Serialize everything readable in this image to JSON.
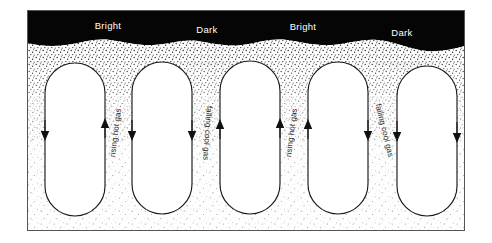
{
  "figure": {
    "frame": {
      "x": 27,
      "y": 10,
      "width": 438,
      "height": 221,
      "border_color": "#4a4a4a"
    },
    "colors": {
      "photosphere_dark": "#050505",
      "stipple": "#2b2b2b",
      "cell_fill": "#ffffff",
      "cell_outline": "#1a1a1a",
      "frame": "#555555",
      "surface_text": "#ffffff",
      "flow_text": "#2a2a2a"
    },
    "surface_labels": [
      {
        "text": "Bright",
        "x": 108,
        "y": 29,
        "region": "rising-column-1"
      },
      {
        "text": "Dark",
        "x": 207,
        "y": 33,
        "region": "falling-column-1"
      },
      {
        "text": "Bright",
        "x": 303,
        "y": 30,
        "region": "rising-column-2"
      },
      {
        "text": "Dark",
        "x": 402,
        "y": 36,
        "region": "falling-column-2"
      }
    ],
    "flow_labels": [
      {
        "text": "rising hot gas",
        "x": 118,
        "y": 133,
        "rotate": -83,
        "kind": "rising"
      },
      {
        "text": "falling cool gas",
        "x": 205,
        "y": 133,
        "rotate": 94,
        "kind": "falling"
      },
      {
        "text": "rising hot gas",
        "x": 294,
        "y": 133,
        "rotate": -83,
        "kind": "rising"
      },
      {
        "text": "falling cool gas",
        "x": 382,
        "y": 131,
        "rotate": 76,
        "kind": "falling"
      }
    ],
    "cells": [
      {
        "cx": 75,
        "top": 63,
        "bottom": 216,
        "half_width": 30
      },
      {
        "cx": 162,
        "top": 62,
        "bottom": 214,
        "half_width": 30
      },
      {
        "cx": 250,
        "top": 61,
        "bottom": 214,
        "half_width": 30
      },
      {
        "cx": 338,
        "top": 62,
        "bottom": 214,
        "half_width": 30
      },
      {
        "cx": 427,
        "top": 66,
        "bottom": 216,
        "half_width": 30
      }
    ],
    "arrows": [
      {
        "x": 46,
        "y": 131,
        "dir": "down",
        "side": "left"
      },
      {
        "x": 104,
        "y": 129,
        "dir": "up",
        "side": "right"
      },
      {
        "x": 133,
        "y": 130,
        "dir": "down",
        "side": "left"
      },
      {
        "x": 192,
        "y": 131,
        "dir": "down",
        "side": "right"
      },
      {
        "x": 220,
        "y": 131,
        "dir": "up",
        "side": "left"
      },
      {
        "x": 280,
        "y": 129,
        "dir": "up",
        "side": "right"
      },
      {
        "x": 309,
        "y": 130,
        "dir": "up",
        "side": "left"
      },
      {
        "x": 368,
        "y": 131,
        "dir": "down",
        "side": "right"
      },
      {
        "x": 397,
        "y": 132,
        "dir": "down",
        "side": "left"
      },
      {
        "x": 456,
        "y": 133,
        "dir": "down",
        "side": "right"
      }
    ]
  }
}
